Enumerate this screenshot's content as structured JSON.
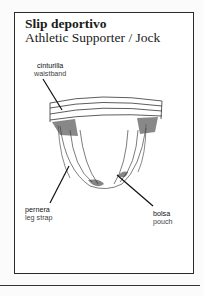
{
  "document": {
    "title": "Slip deportivo",
    "subtitle": "Athletic Supporter / Jock"
  },
  "labels": [
    {
      "id": "waistband",
      "spanish": "cinturilla",
      "english": "waistband"
    },
    {
      "id": "leg-strap",
      "spanish": "pernera",
      "english": "leg strap"
    },
    {
      "id": "pouch",
      "spanish": "bolsa",
      "english": "pouch"
    }
  ],
  "illustration": {
    "subject": "athletic-supporter-drawing"
  }
}
